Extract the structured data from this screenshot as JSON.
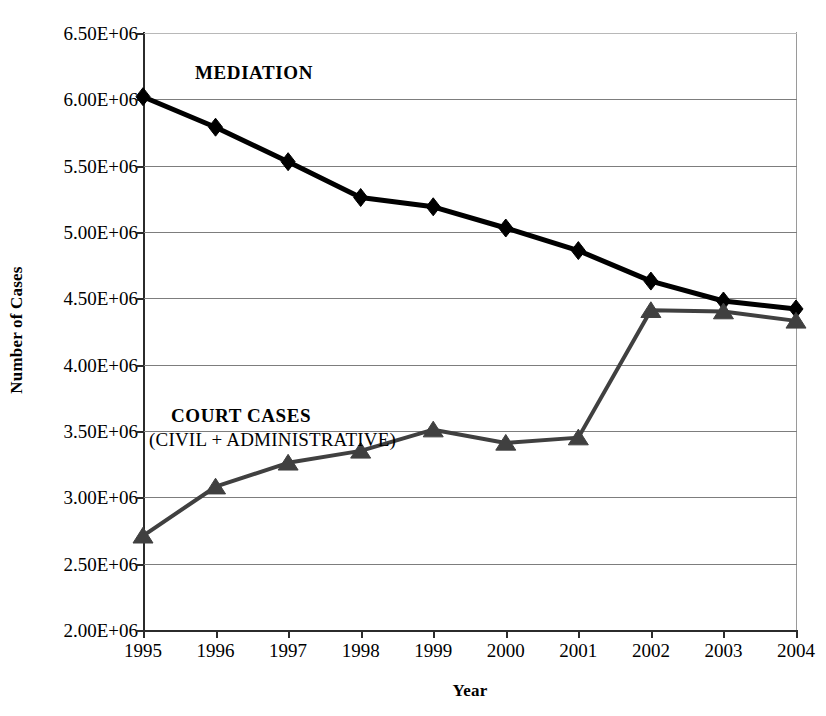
{
  "chart_data": {
    "type": "line",
    "title": "",
    "xlabel": "Year",
    "ylabel": "Number of Cases",
    "categories": [
      "1995",
      "1996",
      "1997",
      "1998",
      "1999",
      "2000",
      "2001",
      "2002",
      "2003",
      "2004"
    ],
    "x": [
      1995,
      1996,
      1997,
      1998,
      1999,
      2000,
      2001,
      2002,
      2003,
      2004
    ],
    "ylim": [
      2000000,
      6500000
    ],
    "xlim": [
      1995,
      2004
    ],
    "yticks": [
      2000000,
      2500000,
      3000000,
      3500000,
      4000000,
      4500000,
      5000000,
      5500000,
      6000000,
      6500000
    ],
    "ytick_labels": [
      "2.00E+06",
      "2.50E+06",
      "3.00E+06",
      "3.50E+06",
      "4.00E+06",
      "4.50E+06",
      "5.00E+06",
      "5.50E+06",
      "6.00E+06",
      "6.50E+06"
    ],
    "grid": true,
    "legend_position": "inline-annotation",
    "series": [
      {
        "name": "MEDIATION",
        "marker": "diamond",
        "color": "#000000",
        "values": [
          6020000,
          5790000,
          5530000,
          5260000,
          5190000,
          5030000,
          4860000,
          4630000,
          4480000,
          4420000
        ]
      },
      {
        "name": "COURT CASES (CIVIL + ADMINISTRATIVE)",
        "marker": "triangle",
        "color": "#404040",
        "values": [
          2710000,
          3080000,
          3260000,
          3350000,
          3510000,
          3410000,
          3450000,
          4410000,
          4400000,
          4330000
        ]
      }
    ],
    "annotations": [
      {
        "text": "MEDIATION",
        "bold": true
      },
      {
        "text": "COURT CASES",
        "bold": true
      },
      {
        "text": "(CIVIL + ADMINISTRATIVE)",
        "bold": false
      }
    ]
  },
  "axes": {
    "y_title": "Number of Cases",
    "x_title": "Year"
  },
  "annotations": {
    "mediation": "MEDIATION",
    "court_cases": "COURT CASES",
    "court_cases_sub": "(CIVIL + ADMINISTRATIVE)"
  },
  "colors": {
    "mediation": "#000000",
    "court": "#404040",
    "grid": "#7d7d7d",
    "axis": "#2b2b2b",
    "background": "#ffffff"
  }
}
